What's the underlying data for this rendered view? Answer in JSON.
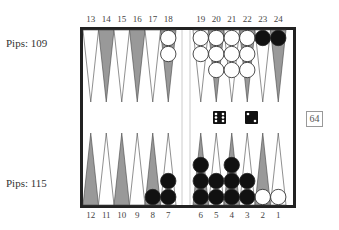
{
  "pips": {
    "top": "Pips: 109",
    "bottom": "Pips: 115"
  },
  "top_points": [
    "13",
    "14",
    "15",
    "16",
    "17",
    "18",
    "19",
    "20",
    "21",
    "22",
    "23",
    "24"
  ],
  "bottom_points": [
    "12",
    "11",
    "10",
    "9",
    "8",
    "7",
    "6",
    "5",
    "4",
    "3",
    "2",
    "1"
  ],
  "cube": "64",
  "dice": [
    6,
    2
  ],
  "checkers": {
    "white": {
      "18": 2,
      "19": 2,
      "20": 3,
      "21": 3,
      "22": 3,
      "2": 1,
      "1": 1
    },
    "black": {
      "23": 1,
      "24": 1,
      "8": 1,
      "7": 2,
      "6": 3,
      "5": 2,
      "4": 3,
      "3": 2
    }
  },
  "colors": {
    "dark_point": "#999999",
    "light_point": "#ffffff",
    "black_checker": "#111111",
    "white_checker": "#ffffff",
    "frame": "#222222"
  }
}
